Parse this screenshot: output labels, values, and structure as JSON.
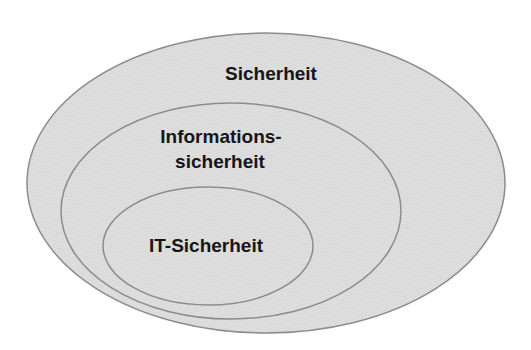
{
  "diagram": {
    "type": "nested-sets",
    "colors": {
      "fill": "#dcdcdc",
      "stroke": "#8c8c8c",
      "text": "#161616"
    },
    "sets": [
      {
        "id": "outer",
        "label_lines": [
          "Sicherheit"
        ]
      },
      {
        "id": "middle",
        "label_lines": [
          "Informations-",
          "sicherheit"
        ]
      },
      {
        "id": "inner",
        "label_lines": [
          "IT-Sicherheit"
        ]
      }
    ]
  }
}
